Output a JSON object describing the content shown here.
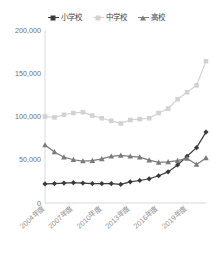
{
  "chart_data": {
    "type": "line",
    "title": "",
    "xlabel": "",
    "ylabel": "",
    "grid": false,
    "legend_position": "top-center",
    "ylim": [
      0,
      200000
    ],
    "yticks": [
      0,
      50000,
      100000,
      150000,
      200000
    ],
    "ytick_labels": [
      "0",
      "50,000",
      "100,000",
      "150,000",
      "200,000"
    ],
    "categories": [
      "2004年度",
      "2005年度",
      "2006年度",
      "2007年度",
      "2008年度",
      "2009年度",
      "2010年度",
      "2011年度",
      "2012年度",
      "2013年度",
      "2014年度",
      "2015年度",
      "2016年度",
      "2017年度",
      "2018年度",
      "2019年度",
      "2020年度",
      "2021年度"
    ],
    "xtick_labels": [
      "2004年度",
      "2007年度",
      "2010年度",
      "2013年度",
      "2016年度",
      "2019年度"
    ],
    "xtick_indices": [
      0,
      3,
      6,
      9,
      12,
      15
    ],
    "series": [
      {
        "name": "小学校",
        "color": "#3a3a3a",
        "marker": "diamond",
        "values": [
          22000,
          22500,
          23000,
          23500,
          23000,
          22500,
          22500,
          22500,
          21500,
          24500,
          26000,
          28000,
          31500,
          36000,
          44000,
          54000,
          64000,
          82000
        ]
      },
      {
        "name": "中学校",
        "color": "#d2d2d2",
        "marker": "square",
        "values": [
          100000,
          99000,
          102000,
          104000,
          105000,
          101000,
          98000,
          95000,
          92000,
          96000,
          97000,
          98000,
          104000,
          109000,
          120000,
          128000,
          136000,
          164000
        ]
      },
      {
        "name": "高校",
        "color": "#7a7a7a",
        "marker": "triangle",
        "values": [
          67000,
          59000,
          53000,
          50000,
          48500,
          49000,
          51000,
          54000,
          55000,
          54000,
          53000,
          49500,
          47000,
          47500,
          49000,
          51500,
          44500,
          52000
        ]
      }
    ]
  }
}
